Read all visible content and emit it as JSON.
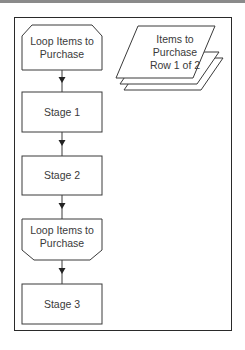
{
  "diagram": {
    "type": "flowchart",
    "nodes": [
      {
        "id": "loop_start",
        "shape": "loop-start",
        "label": "Loop Items to Purchase"
      },
      {
        "id": "stage1",
        "shape": "process",
        "label": "Stage 1"
      },
      {
        "id": "stage2",
        "shape": "process",
        "label": "Stage 2"
      },
      {
        "id": "loop_end",
        "shape": "loop-end",
        "label": "Loop Items to Purchase"
      },
      {
        "id": "stage3",
        "shape": "process",
        "label": "Stage 3"
      },
      {
        "id": "collection",
        "shape": "stacked-parallelogram",
        "label": "Items to Purchase Row 1 of 2"
      }
    ],
    "edges": [
      {
        "from": "loop_start",
        "to": "stage1"
      },
      {
        "from": "stage1",
        "to": "stage2"
      },
      {
        "from": "stage2",
        "to": "loop_end"
      },
      {
        "from": "loop_end",
        "to": "stage3"
      }
    ],
    "labels": {
      "loop_start_line1": "Loop Items to",
      "loop_start_line2": "Purchase",
      "stage1": "Stage 1",
      "stage2": "Stage 2",
      "loop_end_line1": "Loop Items to",
      "loop_end_line2": "Purchase",
      "stage3": "Stage 3",
      "collection_line1": "Items to",
      "collection_line2": "Purchase",
      "collection_line3": "Row 1 of 2"
    },
    "colors": {
      "stroke": "#2a2a2a",
      "text": "#3a3a3a",
      "background": "#ffffff"
    }
  }
}
